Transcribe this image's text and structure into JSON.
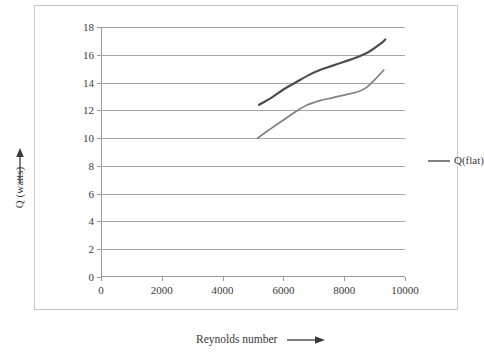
{
  "chart_data": {
    "type": "line",
    "title": "",
    "xlabel": "Reynolds number",
    "ylabel": "Q (watts)",
    "xlim": [
      0,
      10000
    ],
    "ylim": [
      0,
      18
    ],
    "xticks": [
      0,
      2000,
      4000,
      6000,
      8000,
      10000
    ],
    "yticks": [
      0,
      2,
      4,
      6,
      8,
      10,
      12,
      14,
      16,
      18
    ],
    "grid": "horizontal",
    "legend_position": "right",
    "legend_entries": [
      "Q(flat)"
    ],
    "series": [
      {
        "name": "Q(upper)",
        "color": "#4d4d4d",
        "x": [
          5200,
          5600,
          6000,
          6400,
          6800,
          7200,
          7600,
          8000,
          8400,
          8800,
          9200,
          9350
        ],
        "y": [
          12.4,
          12.9,
          13.5,
          14.0,
          14.5,
          14.9,
          15.2,
          15.5,
          15.8,
          16.2,
          16.8,
          17.1
        ]
      },
      {
        "name": "Q(flat)",
        "color": "#808080",
        "x": [
          5150,
          5600,
          6000,
          6400,
          6800,
          7200,
          7600,
          8000,
          8400,
          8700,
          9000,
          9300
        ],
        "y": [
          10.0,
          10.7,
          11.3,
          11.9,
          12.4,
          12.7,
          12.9,
          13.1,
          13.3,
          13.6,
          14.2,
          14.9
        ]
      }
    ]
  },
  "axes": {
    "y_tick_labels": [
      "0",
      "2",
      "4",
      "6",
      "8",
      "10",
      "12",
      "14",
      "16",
      "18"
    ],
    "x_tick_labels": [
      "0",
      "2000",
      "4000",
      "6000",
      "8000",
      "10000"
    ],
    "y_title": "Q (watts)",
    "x_title": "Reynolds number"
  },
  "legend": {
    "label": "Q(flat)",
    "color": "#808080"
  },
  "colors": {
    "grid": "#a6a6a6",
    "axis": "#9a9a9a",
    "border": "#c9c9c9",
    "text": "#3a3a3a",
    "series_upper": "#4d4d4d",
    "series_lower": "#808080"
  }
}
